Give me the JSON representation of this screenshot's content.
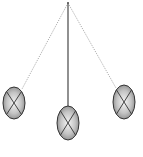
{
  "diagram": {
    "type": "pendulum",
    "pivot": {
      "x": 68,
      "y": 3
    },
    "positions": [
      {
        "name": "left-extreme",
        "string_style": "dotted",
        "bob": {
          "cx": 14,
          "cy": 103,
          "rx": 11,
          "ry": 16
        }
      },
      {
        "name": "equilibrium",
        "string_style": "solid",
        "bob": {
          "cx": 68,
          "cy": 123,
          "rx": 11,
          "ry": 17
        }
      },
      {
        "name": "right-extreme",
        "string_style": "dotted",
        "bob": {
          "cx": 124,
          "cy": 102,
          "rx": 11,
          "ry": 17
        }
      }
    ],
    "colors": {
      "background": "#ffffff",
      "rod": "#555555",
      "dotted_string": "#888888",
      "bob_outline": "#333333",
      "bob_fill_center": "#f4f4f4",
      "bob_fill_edge": "#8a8a8a",
      "bob_cross": "#333333"
    }
  }
}
